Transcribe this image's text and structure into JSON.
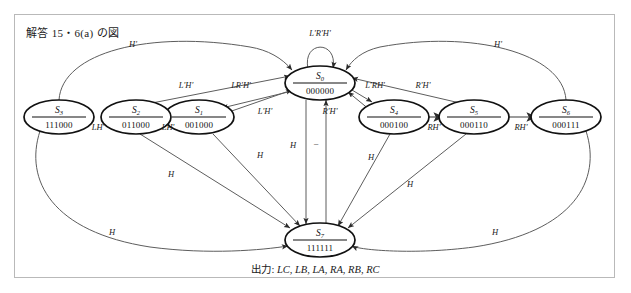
{
  "figure": {
    "title": "解答 15・6(a) の図",
    "caption_label": "出力:",
    "caption_signals": "LC, LB, LA, RA, RB, RC"
  },
  "diagram": {
    "type": "state-transition-diagram",
    "states": [
      {
        "id": "S0",
        "name": "S",
        "sub": "0",
        "code": "000000",
        "cx": 320,
        "cy": 83
      },
      {
        "id": "S1",
        "name": "S",
        "sub": "1",
        "code": "001000",
        "cx": 199,
        "cy": 117
      },
      {
        "id": "S2",
        "name": "S",
        "sub": "2",
        "code": "011000",
        "cx": 136,
        "cy": 117
      },
      {
        "id": "S3",
        "name": "S",
        "sub": "3",
        "code": "111000",
        "cx": 59,
        "cy": 117
      },
      {
        "id": "S4",
        "name": "S",
        "sub": "4",
        "code": "000100",
        "cx": 394,
        "cy": 117
      },
      {
        "id": "S5",
        "name": "S",
        "sub": "5",
        "code": "000110",
        "cx": 474,
        "cy": 117
      },
      {
        "id": "S6",
        "name": "S",
        "sub": "6",
        "code": "000111",
        "cx": 566,
        "cy": 117
      },
      {
        "id": "S7",
        "name": "S",
        "sub": "7",
        "code": "111111",
        "cx": 320,
        "cy": 240
      }
    ],
    "edge_labels": [
      {
        "text": "L'R'H'",
        "x": 320,
        "y": 36,
        "name": "self-loop-s0"
      },
      {
        "text": "H'",
        "x": 133,
        "y": 47,
        "name": "s3-to-s0-return"
      },
      {
        "text": "H'",
        "x": 498,
        "y": 47,
        "name": "s6-to-s0-return"
      },
      {
        "text": "L'H'",
        "x": 186,
        "y": 88,
        "name": "s2-to-s0"
      },
      {
        "text": "LR'H'",
        "x": 241,
        "y": 88,
        "name": "s0-to-s1"
      },
      {
        "text": "L'H'",
        "x": 265,
        "y": 114,
        "name": "s1-to-s0"
      },
      {
        "text": "L'RH'",
        "x": 375,
        "y": 88,
        "name": "s0-to-s4"
      },
      {
        "text": "R'H'",
        "x": 423,
        "y": 88,
        "name": "s5-to-s0"
      },
      {
        "text": "R'H'",
        "x": 330,
        "y": 114,
        "name": "s4-to-s0"
      },
      {
        "text": "LH'",
        "x": 98,
        "y": 130,
        "name": "s2-to-s3"
      },
      {
        "text": "LH'",
        "x": 168,
        "y": 130,
        "name": "s1-to-s2"
      },
      {
        "text": "RH'",
        "x": 434,
        "y": 130,
        "name": "s4-to-s5"
      },
      {
        "text": "RH'",
        "x": 521,
        "y": 130,
        "name": "s5-to-s6"
      },
      {
        "text": "H",
        "x": 171,
        "y": 177,
        "name": "s2-to-s7"
      },
      {
        "text": "H",
        "x": 260,
        "y": 158,
        "name": "s1-to-s7"
      },
      {
        "text": "H",
        "x": 293,
        "y": 148,
        "name": "s0-to-s7"
      },
      {
        "text": "–",
        "x": 316,
        "y": 146,
        "name": "s7-to-s0"
      },
      {
        "text": "H",
        "x": 371,
        "y": 160,
        "name": "s4-to-s7"
      },
      {
        "text": "H",
        "x": 410,
        "y": 187,
        "name": "s5-to-s7"
      },
      {
        "text": "H",
        "x": 112,
        "y": 235,
        "name": "s3-to-s7"
      },
      {
        "text": "H",
        "x": 495,
        "y": 235,
        "name": "s6-to-s7"
      }
    ]
  }
}
